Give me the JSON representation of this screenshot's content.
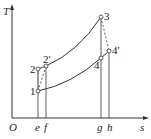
{
  "diagram": {
    "type": "T-s diagram",
    "axes": {
      "y_label": "T",
      "x_label": "s",
      "origin_label": "O"
    },
    "points": [
      {
        "id": "1",
        "label": "1"
      },
      {
        "id": "2",
        "label": "2"
      },
      {
        "id": "2p",
        "label": "2′"
      },
      {
        "id": "3",
        "label": "3"
      },
      {
        "id": "4",
        "label": "4"
      },
      {
        "id": "4p",
        "label": "4′"
      }
    ],
    "x_ticks": [
      "e",
      "f",
      "g",
      "h"
    ],
    "colors": {
      "line": "#333333",
      "background": "#ffffff"
    }
  }
}
